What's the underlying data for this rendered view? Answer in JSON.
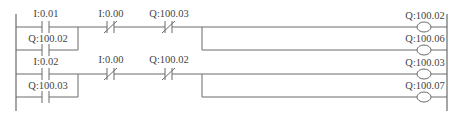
{
  "diagram": {
    "type": "ladder-logic",
    "rungs": [
      {
        "index": 1,
        "parallel_contacts": [
          {
            "label": "I:0.01",
            "type": "NO"
          },
          {
            "label": "Q:100.02",
            "type": "NO"
          }
        ],
        "series_contacts": [
          {
            "label": "I:0.00",
            "type": "NC"
          },
          {
            "label": "Q:100.03",
            "type": "NC"
          }
        ],
        "coils": [
          {
            "label": "Q:100.02"
          },
          {
            "label": "Q:100.06"
          }
        ]
      },
      {
        "index": 2,
        "parallel_contacts": [
          {
            "label": "I:0.02",
            "type": "NO"
          },
          {
            "label": "Q:100.03",
            "type": "NO"
          }
        ],
        "series_contacts": [
          {
            "label": "I:0.00",
            "type": "NC"
          },
          {
            "label": "Q:100.02",
            "type": "NC"
          }
        ],
        "coils": [
          {
            "label": "Q:100.03"
          },
          {
            "label": "Q:100.07"
          }
        ]
      }
    ],
    "colors": {
      "line": "#6a6a6a",
      "text": "#444444",
      "background": "#ffffff"
    }
  }
}
